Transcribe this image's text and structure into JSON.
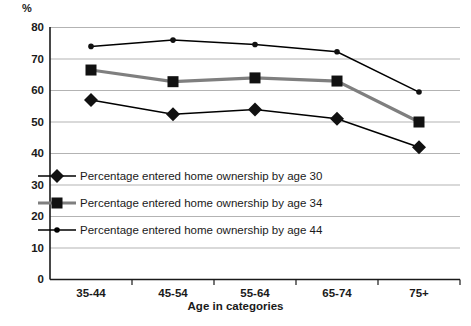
{
  "chart_data": {
    "type": "line",
    "title": "",
    "xlabel": "Age in categories",
    "ylabel": "%",
    "categories": [
      "35-44",
      "45-54",
      "55-64",
      "65-74",
      "75+"
    ],
    "ylim": [
      0,
      80
    ],
    "yticks": [
      0,
      10,
      20,
      30,
      40,
      50,
      60,
      70,
      80
    ],
    "grid": true,
    "legend_position": "inside-lower-left",
    "series": [
      {
        "name": "Percentage entered home ownership by age 30",
        "marker": "diamond",
        "color": "#000000",
        "line_width": 1,
        "values": [
          57,
          52.5,
          54,
          51,
          42
        ]
      },
      {
        "name": "Percentage entered home ownership by age 34",
        "marker": "square",
        "color": "#7f7f7f",
        "line_width": 3,
        "values": [
          66.5,
          62.8,
          64,
          63,
          50
        ]
      },
      {
        "name": "Percentage entered home ownership by age 44",
        "marker": "circle",
        "color": "#000000",
        "line_width": 1,
        "values": [
          74,
          76,
          74.6,
          72.3,
          59.5
        ]
      }
    ]
  },
  "axis": {
    "y_unit": "%",
    "y_labels": [
      "80",
      "70",
      "60",
      "50",
      "40",
      "30",
      "20",
      "10",
      "0"
    ],
    "x_labels": [
      "35-44",
      "45-54",
      "55-64",
      "65-74",
      "75+"
    ],
    "x_title": "Age in categories"
  },
  "legend": {
    "items": [
      {
        "label": "Percentage entered home ownership by age 30",
        "marker": "diamond-marker"
      },
      {
        "label": "Percentage entered home ownership by age 34",
        "marker": "square-marker"
      },
      {
        "label": "Percentage entered home ownership by age 44",
        "marker": "circle-marker"
      }
    ]
  },
  "colors": {
    "grid": "#b3b3b3",
    "axis": "#1a1a1a",
    "series_dark": "#000000",
    "series_gray": "#7f7f7f"
  }
}
